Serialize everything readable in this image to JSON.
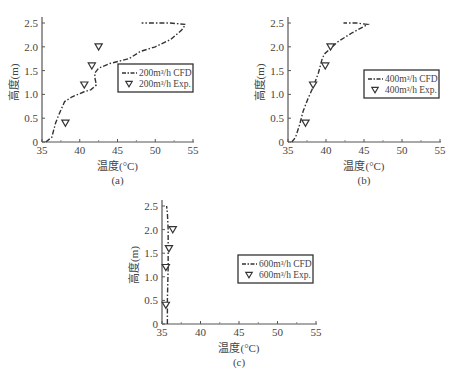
{
  "chart_data": [
    {
      "type": "line",
      "panel_label": "(a)",
      "xlabel": "温度(°C)",
      "ylabel": "高度(m)",
      "xlim": [
        35,
        55
      ],
      "ylim": [
        0,
        2.5
      ],
      "xticks": [
        35,
        40,
        45,
        50,
        55
      ],
      "yticks": [
        0,
        0.5,
        1.0,
        1.5,
        2.0,
        2.5
      ],
      "ytick_labels": [
        "0",
        "0.5",
        "1.0",
        "1.5",
        "2.0",
        "2.5"
      ],
      "legend_position": "center-right",
      "series": [
        {
          "name": "200m³/h CFD",
          "style": "dash-dot",
          "x": [
            35.5,
            36.3,
            36.8,
            37.3,
            38.0,
            39.0,
            40.5,
            41.5,
            42.2,
            42.0,
            42.0,
            42.5,
            44.0,
            46.5,
            48.0,
            50.0,
            52.0,
            53.5,
            54.0,
            52.0,
            48.2
          ],
          "y": [
            0.0,
            0.1,
            0.4,
            0.6,
            0.85,
            0.95,
            1.05,
            1.1,
            1.2,
            1.35,
            1.45,
            1.55,
            1.65,
            1.75,
            1.9,
            2.0,
            2.15,
            2.35,
            2.47,
            2.5,
            2.5
          ]
        },
        {
          "name": "200m³/h Exp.",
          "style": "marker-triangle-down",
          "x": [
            38.1,
            40.6,
            41.6,
            42.5
          ],
          "y": [
            0.4,
            1.2,
            1.6,
            2.0
          ]
        }
      ]
    },
    {
      "type": "line",
      "panel_label": "(b)",
      "xlabel": "温度(°C)",
      "ylabel": "高度(m)",
      "xlim": [
        35,
        55
      ],
      "ylim": [
        0,
        2.5
      ],
      "xticks": [
        35,
        40,
        45,
        50,
        55
      ],
      "yticks": [
        0,
        0.5,
        1.0,
        1.5,
        2.0,
        2.5
      ],
      "ytick_labels": [
        "0",
        "0.5",
        "1.0",
        "1.5",
        "2.0",
        "2.5"
      ],
      "legend_position": "center-right",
      "series": [
        {
          "name": "400m³/h CFD",
          "style": "dash-dot",
          "x": [
            35.5,
            36.0,
            36.5,
            37.0,
            37.6,
            38.3,
            39.0,
            39.5,
            39.8,
            40.5,
            41.5,
            43.5,
            45.5,
            44.0,
            42.3
          ],
          "y": [
            0.0,
            0.1,
            0.35,
            0.65,
            0.9,
            1.15,
            1.45,
            1.75,
            1.85,
            1.95,
            2.1,
            2.3,
            2.47,
            2.5,
            2.5
          ]
        },
        {
          "name": "400m³/h Exp.",
          "style": "marker-triangle-down",
          "x": [
            37.3,
            38.3,
            39.9,
            40.6
          ],
          "y": [
            0.4,
            1.2,
            1.6,
            2.0
          ]
        }
      ]
    },
    {
      "type": "line",
      "panel_label": "(c)",
      "xlabel": "温度(°C)",
      "ylabel": "高度(m)",
      "xlim": [
        35,
        55
      ],
      "ylim": [
        0,
        2.5
      ],
      "xticks": [
        35,
        40,
        45,
        50,
        55
      ],
      "yticks": [
        0,
        0.5,
        1.0,
        1.5,
        2.0,
        2.5
      ],
      "ytick_labels": [
        "0",
        "0.5",
        "1.0",
        "1.5",
        "2.0",
        "2.5"
      ],
      "legend_position": "center-right",
      "series": [
        {
          "name": "600m³/h CFD",
          "style": "dash-dot",
          "x": [
            35.7,
            35.7,
            35.8,
            35.8,
            35.7,
            35.6
          ],
          "y": [
            0.0,
            0.5,
            1.2,
            2.0,
            2.35,
            2.5
          ]
        },
        {
          "name": "600m³/h Exp.",
          "style": "marker-triangle-down",
          "x": [
            35.5,
            35.5,
            35.9,
            36.4
          ],
          "y": [
            0.4,
            1.2,
            1.6,
            2.0
          ]
        }
      ]
    }
  ]
}
